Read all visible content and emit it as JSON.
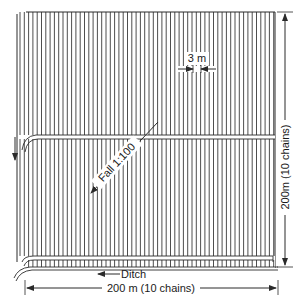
{
  "figure": {
    "type": "field drainage layout (plan view)",
    "colors": {
      "ink": "#2a2a2a",
      "background": "#ffffff",
      "band_fill": "#ffffff"
    }
  },
  "labels": {
    "spacing": "3 m",
    "fall": "Fall 1:100",
    "ditch": "Ditch",
    "width": "200 m (10 chains)",
    "height": "200m (10 chains)"
  },
  "field": {
    "left": 17,
    "top": 12,
    "right": 275,
    "bottom": 268,
    "furrow_spacing_px": 4.3,
    "mid_channel_y": 137,
    "ditch_band": {
      "top": 256,
      "bottom": 267
    }
  }
}
